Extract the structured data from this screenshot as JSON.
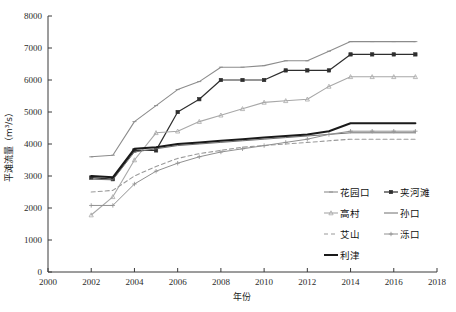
{
  "chart_data": {
    "type": "line",
    "title": "",
    "xlabel": "年份",
    "ylabel": "平滩流量（m³/s）",
    "xlim": [
      2000,
      2018
    ],
    "ylim": [
      0,
      8000
    ],
    "xticks": [
      2000,
      2002,
      2004,
      2006,
      2008,
      2010,
      2012,
      2014,
      2016,
      2018
    ],
    "yticks": [
      0,
      1000,
      2000,
      3000,
      4000,
      5000,
      6000,
      7000,
      8000
    ],
    "grid": false,
    "legend_position": "lower-right",
    "x": [
      2002,
      2003,
      2004,
      2005,
      2006,
      2007,
      2008,
      2009,
      2010,
      2011,
      2012,
      2013,
      2014,
      2015,
      2016,
      2017
    ],
    "series": [
      {
        "name": "花园口",
        "color": "#8c8c8c",
        "marker": "line",
        "dash": "none",
        "width": 1.1,
        "values": [
          3600,
          3650,
          4700,
          5200,
          5700,
          5950,
          6400,
          6400,
          6450,
          6600,
          6600,
          6900,
          7200,
          7200,
          7200,
          7200
        ]
      },
      {
        "name": "夹河滩",
        "color": "#2e2e2e",
        "marker": "square",
        "dash": "none",
        "width": 1.2,
        "values": [
          2950,
          2900,
          3800,
          3800,
          5000,
          5400,
          6000,
          6000,
          6000,
          6300,
          6300,
          6300,
          6800,
          6800,
          6800,
          6800
        ]
      },
      {
        "name": "高村",
        "color": "#a8a8a8",
        "marker": "triangle",
        "dash": "none",
        "width": 1.1,
        "values": [
          1780,
          2350,
          3500,
          4350,
          4400,
          4700,
          4900,
          5100,
          5300,
          5350,
          5400,
          5800,
          6100,
          6100,
          6100,
          6100
        ]
      },
      {
        "name": "孙口",
        "color": "#6e6e6e",
        "marker": "none",
        "dash": "none",
        "width": 1.0,
        "values": [
          2900,
          2880,
          3750,
          3850,
          3950,
          4000,
          4050,
          4100,
          4150,
          4200,
          4250,
          4300,
          4350,
          4350,
          4350,
          4350
        ]
      },
      {
        "name": "艾山",
        "color": "#9a9a9a",
        "marker": "none",
        "dash": "dashed",
        "width": 1.1,
        "values": [
          2500,
          2550,
          3000,
          3300,
          3550,
          3700,
          3800,
          3900,
          3950,
          4000,
          4050,
          4100,
          4150,
          4150,
          4150,
          4150
        ]
      },
      {
        "name": "泺口",
        "color": "#909090",
        "marker": "plus",
        "dash": "none",
        "width": 1.0,
        "values": [
          2080,
          2080,
          2750,
          3150,
          3400,
          3600,
          3750,
          3850,
          3950,
          4050,
          4150,
          4300,
          4400,
          4400,
          4400,
          4400
        ]
      },
      {
        "name": "利津",
        "color": "#1a1a1a",
        "marker": "none",
        "dash": "none",
        "width": 2.0,
        "values": [
          3000,
          2960,
          3850,
          3900,
          4000,
          4050,
          4100,
          4150,
          4200,
          4250,
          4300,
          4400,
          4650,
          4650,
          4650,
          4650
        ]
      }
    ]
  },
  "legend": {
    "items": [
      {
        "label": "花园口"
      },
      {
        "label": "夹河滩"
      },
      {
        "label": "高村"
      },
      {
        "label": "孙口"
      },
      {
        "label": "艾山"
      },
      {
        "label": "泺口"
      },
      {
        "label": "利津"
      }
    ]
  },
  "axes": {
    "x_title": "年份",
    "y_title": "平滩流量（m³/s）"
  }
}
